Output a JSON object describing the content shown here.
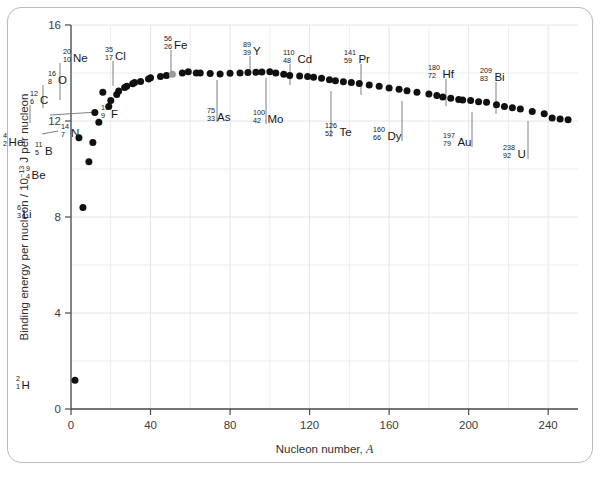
{
  "figure": {
    "frame_border_color": "#b9b9bb",
    "background": "#ffffff"
  },
  "chart_data": {
    "type": "scatter",
    "title": "",
    "xlabel": "Nucleon number, A",
    "ylabel": "Binding energy per nucleon / 10⁻¹³ J per nucleon",
    "ylabel_parts": {
      "prefix": "Binding energy per nucleon / 10",
      "exponent": "−13",
      "suffix": " J per nucleon"
    },
    "xlabel_parts": {
      "prefix": "Nucleon number, ",
      "symbol": "A"
    },
    "xlim": [
      0,
      255
    ],
    "ylim": [
      0,
      16
    ],
    "xticks": [
      0,
      40,
      80,
      120,
      160,
      200,
      240
    ],
    "xtick_labels": [
      "0",
      "40",
      "80",
      "120",
      "160",
      "200",
      "240"
    ],
    "yticks": [
      0,
      4,
      8,
      12,
      16
    ],
    "ytick_labels": [
      "0",
      "4",
      "8",
      "12",
      "16"
    ],
    "x_minor_step": 20,
    "y_minor_step": 2,
    "grid": true,
    "legend": "none",
    "marker_color": "#101010",
    "highlight_color": "#9a9a9c",
    "highlight_point": "Fe-56",
    "x": [
      2,
      4,
      6,
      9,
      11,
      12,
      14,
      16,
      19,
      20,
      23,
      24,
      27,
      28,
      31,
      32,
      35,
      39,
      40,
      45,
      48,
      51,
      56,
      59,
      63,
      65,
      70,
      75,
      80,
      85,
      89,
      93,
      96,
      100,
      103,
      107,
      110,
      115,
      119,
      122,
      126,
      130,
      133,
      137,
      141,
      145,
      150,
      155,
      160,
      165,
      169,
      174,
      180,
      184,
      187,
      191,
      195,
      197,
      201,
      205,
      209,
      214,
      218,
      222,
      226,
      232,
      238,
      242,
      246,
      250
    ],
    "y": [
      1.2,
      11.3,
      8.4,
      10.3,
      11.1,
      12.35,
      11.95,
      13.2,
      12.6,
      12.85,
      13.1,
      13.25,
      13.4,
      13.45,
      13.55,
      13.6,
      13.65,
      13.75,
      13.8,
      13.85,
      13.9,
      13.95,
      14.0,
      14.05,
      14.0,
      14.0,
      13.98,
      13.96,
      13.99,
      14.0,
      14.02,
      14.03,
      14.04,
      14.05,
      14.0,
      13.95,
      13.9,
      13.88,
      13.85,
      13.82,
      13.78,
      13.72,
      13.68,
      13.64,
      13.6,
      13.56,
      13.5,
      13.45,
      13.38,
      13.32,
      13.26,
      13.2,
      13.12,
      13.06,
      13.0,
      12.95,
      12.9,
      12.88,
      12.85,
      12.8,
      12.78,
      12.68,
      12.6,
      12.55,
      12.5,
      12.4,
      12.3,
      12.12,
      12.08,
      12.05
    ],
    "annotations": [
      {
        "id": "H-2",
        "element": "H",
        "mass": "2",
        "atomic": "1",
        "label_x": 16,
        "label_y": 386,
        "point_x": 9,
        "point_y": 391,
        "leader": "none"
      },
      {
        "id": "Li-6",
        "element": "Li",
        "mass": "6",
        "atomic": "3",
        "label_x": 17,
        "label_y": 215,
        "point_x": 10,
        "point_y": 216,
        "leader": "none"
      },
      {
        "id": "Be-9",
        "element": "Be",
        "mass": "9",
        "atomic": "4",
        "label_x": 26,
        "label_y": 176,
        "point_x": 19,
        "point_y": 177,
        "leader": "none"
      },
      {
        "id": "B-11",
        "element": "B",
        "mass": "11",
        "atomic": "5",
        "label_x": 35,
        "label_y": 152,
        "point_x": 27,
        "point_y": 149,
        "leader": "none"
      },
      {
        "id": "He-4",
        "element": "He",
        "mass": "4",
        "atomic": "2",
        "label_x": 3,
        "label_y": 143,
        "point_x": 13,
        "point_y": 148,
        "leader": "none"
      },
      {
        "id": "C-12",
        "element": "C",
        "mass": "12",
        "atomic": "6",
        "label_x": 30,
        "label_y": 101,
        "point_x": 30,
        "point_y": 127,
        "leader": "vertical"
      },
      {
        "id": "N-14",
        "element": "N",
        "mass": "14",
        "atomic": "7",
        "label_x": 61,
        "label_y": 134,
        "point_x": 38,
        "point_y": 134,
        "leader": "horizontal"
      },
      {
        "id": "O-16",
        "element": "O",
        "mass": "16",
        "atomic": "8",
        "label_x": 48,
        "label_y": 81,
        "point_x": 43,
        "point_y": 112,
        "leader": "vertical"
      },
      {
        "id": "F-19",
        "element": "F",
        "mass": "19",
        "atomic": "9",
        "label_x": 101,
        "label_y": 115,
        "point_x": 46,
        "point_y": 115,
        "leader": "horizontal"
      },
      {
        "id": "Ne-20",
        "element": "Ne",
        "mass": "20",
        "atomic": "10",
        "label_x": 63,
        "label_y": 59,
        "point_x": 60,
        "point_y": 104,
        "leader": "vertical"
      },
      {
        "id": "Cl-35",
        "element": "Cl",
        "mass": "35",
        "atomic": "17",
        "label_x": 105,
        "label_y": 57,
        "point_x": 113,
        "point_y": 90,
        "leader": "vertical"
      },
      {
        "id": "Fe-56",
        "element": "Fe",
        "mass": "56",
        "atomic": "26",
        "label_x": 164,
        "label_y": 46,
        "point_x": 171,
        "point_y": 81,
        "leader": "vertical"
      },
      {
        "id": "As-75",
        "element": "As",
        "mass": "75",
        "atomic": "33",
        "label_x": 207,
        "label_y": 118,
        "point_x": 217,
        "point_y": 84,
        "leader": "vertical"
      },
      {
        "id": "Y-89",
        "element": "Y",
        "mass": "89",
        "atomic": "39",
        "label_x": 243,
        "label_y": 52,
        "point_x": 250,
        "point_y": 79,
        "leader": "vertical"
      },
      {
        "id": "Mo-100",
        "element": "Mo",
        "mass": "100",
        "atomic": "42",
        "label_x": 253,
        "label_y": 120,
        "point_x": 266,
        "point_y": 82,
        "leader": "vertical"
      },
      {
        "id": "Cd-110",
        "element": "Cd",
        "mass": "110",
        "atomic": "48",
        "label_x": 283,
        "label_y": 60,
        "point_x": 290,
        "point_y": 89,
        "leader": "vertical"
      },
      {
        "id": "Te-126",
        "element": "Te",
        "mass": "126",
        "atomic": "52",
        "label_x": 325,
        "label_y": 133,
        "point_x": 331,
        "point_y": 95,
        "leader": "vertical"
      },
      {
        "id": "Pr-141",
        "element": "Pr",
        "mass": "141",
        "atomic": "59",
        "label_x": 344,
        "label_y": 60,
        "point_x": 361,
        "point_y": 99,
        "leader": "vertical"
      },
      {
        "id": "Dy-160",
        "element": "Dy",
        "mass": "160",
        "atomic": "66",
        "label_x": 373,
        "label_y": 137,
        "point_x": 402,
        "point_y": 105,
        "leader": "vertical"
      },
      {
        "id": "Hf-180",
        "element": "Hf",
        "mass": "180",
        "atomic": "72",
        "label_x": 428,
        "label_y": 75,
        "point_x": 446,
        "point_y": 110,
        "leader": "vertical"
      },
      {
        "id": "Au-197",
        "element": "Au",
        "mass": "197",
        "atomic": "79",
        "label_x": 443,
        "label_y": 143,
        "point_x": 472,
        "point_y": 116,
        "leader": "vertical"
      },
      {
        "id": "Bi-209",
        "element": "Bi",
        "mass": "209",
        "atomic": "83",
        "label_x": 480,
        "label_y": 78,
        "point_x": 496,
        "point_y": 118,
        "leader": "vertical"
      },
      {
        "id": "U-238",
        "element": "U",
        "mass": "238",
        "atomic": "92",
        "label_x": 503,
        "label_y": 155,
        "point_x": 528,
        "point_y": 125,
        "leader": "vertical"
      }
    ]
  }
}
